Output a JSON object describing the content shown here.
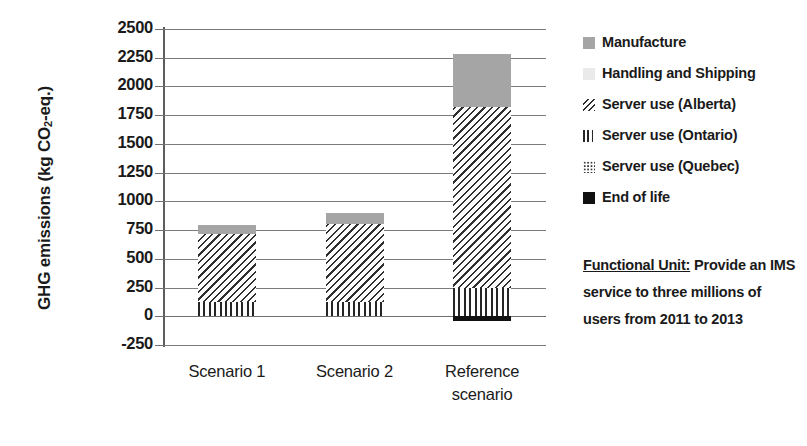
{
  "chart_data": {
    "type": "bar",
    "stacked": true,
    "title": "",
    "xlabel": "",
    "ylabel": "GHG emissions (kg CO2-eq.)",
    "ylim": [
      -250,
      2500
    ],
    "ytick_step": 250,
    "ytick_labels": [
      "2500",
      "2250",
      "2000",
      "1750",
      "1500",
      "1250",
      "1000",
      "750",
      "500",
      "250",
      "0",
      "-250"
    ],
    "ytick_values": [
      2500,
      2250,
      2000,
      1750,
      1500,
      1250,
      1000,
      750,
      500,
      250,
      0,
      -250
    ],
    "grid": true,
    "legend_position": "right",
    "categories": [
      "Scenario 1",
      "Scenario 2",
      "Reference scenario"
    ],
    "series": [
      {
        "name": "End of life",
        "values": [
          0,
          0,
          -40
        ]
      },
      {
        "name": "Server use (Quebec)",
        "values": [
          0,
          0,
          0
        ]
      },
      {
        "name": "Server use (Ontario)",
        "values": [
          120,
          120,
          250
        ]
      },
      {
        "name": "Server use (Alberta)",
        "values": [
          600,
          680,
          1570
        ]
      },
      {
        "name": "Handling and Shipping",
        "values": [
          0,
          0,
          0
        ]
      },
      {
        "name": "Manufacture",
        "values": [
          75,
          95,
          460
        ]
      }
    ],
    "totals": [
      795,
      895,
      2280
    ]
  },
  "axis": {
    "y_title_main": "GHG emissions (kg CO",
    "y_title_sub": "2",
    "y_title_tail": "-eq.)"
  },
  "xlabels": [
    {
      "line1": "Scenario 1",
      "line2": ""
    },
    {
      "line1": "Scenario 2",
      "line2": ""
    },
    {
      "line1": "Reference",
      "line2": "scenario"
    }
  ],
  "legend": {
    "items": [
      {
        "label": "Manufacture",
        "swatch": "manufacture",
        "color": "#a5a5a5"
      },
      {
        "label": "Handling and Shipping",
        "swatch": "handling",
        "color": "#eaeaea"
      },
      {
        "label": "Server use (Alberta)",
        "swatch": "alberta",
        "color": "#2f2f2f"
      },
      {
        "label": "Server use (Ontario)",
        "swatch": "ontario",
        "color": "#252525"
      },
      {
        "label": "Server use (Quebec)",
        "swatch": "quebec",
        "color": "#3a3a3a"
      },
      {
        "label": "End of life",
        "swatch": "endoflife",
        "color": "#111111"
      }
    ]
  },
  "functional_unit": {
    "heading": "Functional Unit:",
    "text": " Provide an IMS service to three millions of users from 2011 to 2013"
  }
}
